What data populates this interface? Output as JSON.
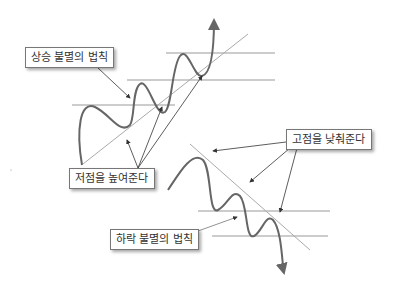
{
  "diagram": {
    "uptrend": {
      "title_label": "상승 불멸의 법칙",
      "lows_label": "저점을 높여준다"
    },
    "downtrend": {
      "highs_label": "고점을 낮춰준다",
      "title_label": "하락 불멸의 법칙"
    },
    "colors": {
      "price_line": "#666666",
      "trend_line": "#aaaaaa",
      "level_line": "#999999",
      "arrow": "#333333",
      "label_border": "#777777"
    }
  }
}
